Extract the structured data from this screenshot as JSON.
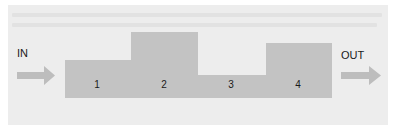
{
  "diagram": {
    "type": "flow-profile",
    "input_label": "IN",
    "output_label": "OUT",
    "colors": {
      "background_panel": "#ededed",
      "block_fill": "#c3c3c3",
      "arrow_fill": "#bdbdbd",
      "text": "#1a1a1a"
    },
    "blocks": [
      {
        "label": "1",
        "x": 65,
        "width": 66,
        "top": 60
      },
      {
        "label": "2",
        "x": 131,
        "width": 67,
        "top": 32
      },
      {
        "label": "3",
        "x": 198,
        "width": 68,
        "top": 75
      },
      {
        "label": "4",
        "x": 266,
        "width": 66,
        "top": 43
      }
    ],
    "baseline": 98
  }
}
